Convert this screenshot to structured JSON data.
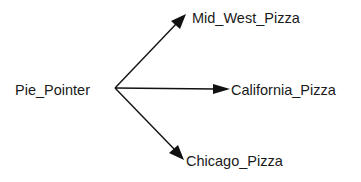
{
  "diagram": {
    "type": "tree",
    "root": {
      "id": "pie_pointer",
      "label": "Pie_Pointer"
    },
    "children": [
      {
        "id": "mid_west_pizza",
        "label": "Mid_West_Pizza"
      },
      {
        "id": "california_pizza",
        "label": "California_Pizza"
      },
      {
        "id": "chicago_pizza",
        "label": "Chicago_Pizza"
      }
    ],
    "edges": [
      {
        "from": "pie_pointer",
        "to": "mid_west_pizza",
        "arrow": "forward"
      },
      {
        "from": "pie_pointer",
        "to": "california_pizza",
        "arrow": "forward"
      },
      {
        "from": "pie_pointer",
        "to": "chicago_pizza",
        "arrow": "forward"
      }
    ],
    "colors": {
      "line": "#111111",
      "text": "#1a1a1a",
      "background": "#ffffff"
    }
  }
}
